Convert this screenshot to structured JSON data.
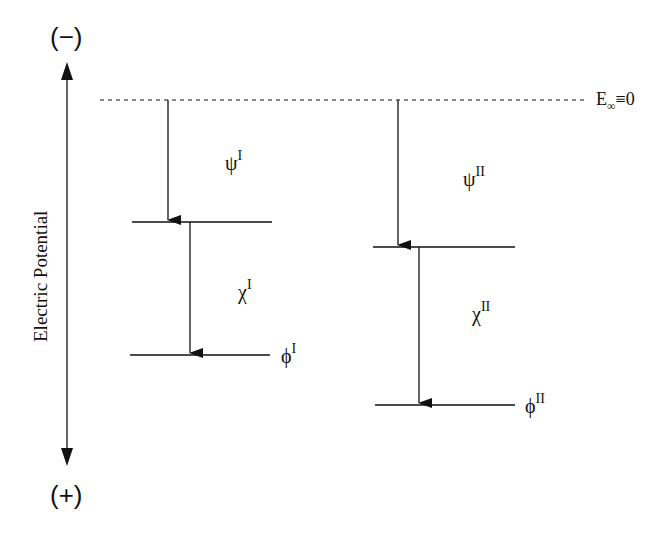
{
  "diagram": {
    "axis": {
      "title": "Electric Potential",
      "top_sign": "(−)",
      "bottom_sign": "(+)"
    },
    "reference": {
      "label_main": "E",
      "label_sub": "∞",
      "label_rest": "≡0"
    },
    "system_I": {
      "psi": {
        "symbol": "ψ",
        "sup": "I"
      },
      "chi": {
        "symbol": "χ",
        "sup": "I"
      },
      "phi": {
        "symbol": "ϕ",
        "sup": "I"
      }
    },
    "system_II": {
      "psi": {
        "symbol": "ψ",
        "sup": "II"
      },
      "chi": {
        "symbol": "χ",
        "sup": "II"
      },
      "phi": {
        "symbol": "ϕ",
        "sup": "II"
      }
    },
    "colors": {
      "line": "#111111",
      "background": "#ffffff"
    }
  }
}
